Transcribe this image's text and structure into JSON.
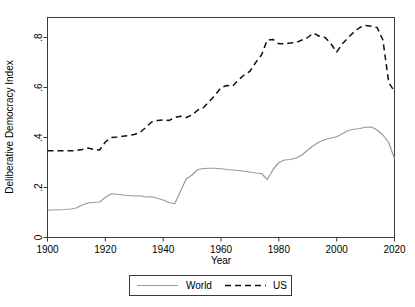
{
  "chart_data": {
    "type": "line",
    "title": "",
    "xlabel": "Year",
    "ylabel": "Deliberative Democracy Index",
    "xlim": [
      1900,
      2020
    ],
    "ylim": [
      0,
      0.88
    ],
    "xticks": [
      1900,
      1920,
      1940,
      1960,
      1980,
      2000,
      2020
    ],
    "xtick_labels": [
      "1900",
      "1920",
      "1940",
      "1960",
      "1980",
      "2000",
      "2020"
    ],
    "yticks": [
      0,
      0.2,
      0.4,
      0.6,
      0.8
    ],
    "ytick_labels": [
      "0",
      ".2",
      ".4",
      ".6",
      ".8"
    ],
    "grid": false,
    "legend_position": "below-center",
    "x": [
      1900,
      1902,
      1904,
      1906,
      1908,
      1910,
      1912,
      1914,
      1916,
      1918,
      1920,
      1922,
      1924,
      1926,
      1928,
      1930,
      1932,
      1934,
      1936,
      1938,
      1940,
      1942,
      1944,
      1946,
      1948,
      1950,
      1952,
      1954,
      1956,
      1958,
      1960,
      1962,
      1964,
      1966,
      1968,
      1970,
      1972,
      1974,
      1976,
      1978,
      1980,
      1982,
      1984,
      1986,
      1988,
      1990,
      1992,
      1994,
      1996,
      1998,
      2000,
      2002,
      2004,
      2006,
      2008,
      2010,
      2012,
      2014,
      2016,
      2018,
      2020
    ],
    "series": [
      {
        "name": "World",
        "style": "solid",
        "color": "#9a9a9a",
        "values": [
          0.109,
          0.11,
          0.111,
          0.112,
          0.114,
          0.118,
          0.13,
          0.138,
          0.14,
          0.142,
          0.16,
          0.175,
          0.173,
          0.17,
          0.168,
          0.166,
          0.167,
          0.162,
          0.163,
          0.157,
          0.15,
          0.14,
          0.135,
          0.185,
          0.235,
          0.25,
          0.272,
          0.276,
          0.277,
          0.277,
          0.275,
          0.272,
          0.27,
          0.268,
          0.265,
          0.262,
          0.258,
          0.256,
          0.232,
          0.272,
          0.3,
          0.31,
          0.312,
          0.318,
          0.33,
          0.35,
          0.368,
          0.382,
          0.392,
          0.398,
          0.403,
          0.415,
          0.428,
          0.433,
          0.436,
          0.441,
          0.442,
          0.43,
          0.41,
          0.38,
          0.315
        ]
      },
      {
        "name": "US",
        "style": "dashed",
        "color": "#111111",
        "values": [
          0.347,
          0.347,
          0.347,
          0.347,
          0.347,
          0.348,
          0.352,
          0.358,
          0.352,
          0.35,
          0.382,
          0.4,
          0.402,
          0.405,
          0.408,
          0.412,
          0.42,
          0.44,
          0.462,
          0.468,
          0.47,
          0.468,
          0.48,
          0.485,
          0.48,
          0.49,
          0.51,
          0.52,
          0.545,
          0.57,
          0.6,
          0.608,
          0.605,
          0.63,
          0.65,
          0.665,
          0.7,
          0.73,
          0.79,
          0.792,
          0.775,
          0.775,
          0.778,
          0.78,
          0.79,
          0.8,
          0.818,
          0.805,
          0.8,
          0.775,
          0.742,
          0.775,
          0.8,
          0.822,
          0.84,
          0.848,
          0.845,
          0.84,
          0.79,
          0.62,
          0.585
        ]
      }
    ],
    "legend": [
      {
        "label": "World",
        "style": "solid",
        "color": "#9a9a9a"
      },
      {
        "label": "US",
        "style": "dashed",
        "color": "#111111"
      }
    ]
  },
  "axes": {
    "y_title": "Deliberative Democracy Index",
    "x_title": "Year"
  }
}
